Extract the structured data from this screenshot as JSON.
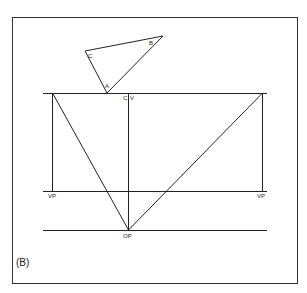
{
  "figure": {
    "caption": "(B)",
    "labels": {
      "triangle_a": "A",
      "triangle_b": "B",
      "triangle_c": "C",
      "center_c": "C",
      "center_v": "V",
      "vp_left": "VP",
      "vp_right": "VP",
      "op": "OP"
    },
    "colors": {
      "line": "#222222",
      "background": "#ffffff"
    }
  }
}
